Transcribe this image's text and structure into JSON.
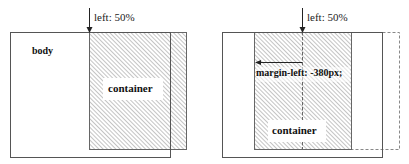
{
  "left_diagram": {
    "arrow_label": "left: 50%",
    "body_label": "body",
    "container_label": "container"
  },
  "right_diagram": {
    "arrow_label": "left: 50%",
    "margin_label": "margin-left: -380px;",
    "container_label": "container"
  },
  "colors": {
    "stroke": "#555555",
    "hatch": "#8a8a8a",
    "text": "#111111"
  }
}
